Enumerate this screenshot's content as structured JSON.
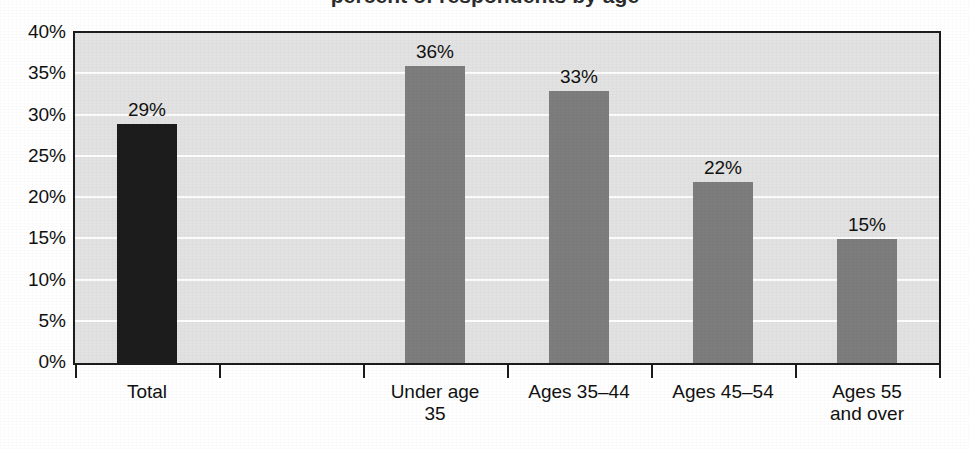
{
  "title_remnant": "percent of respondents by age",
  "chart_data": {
    "type": "bar",
    "title": "",
    "xlabel": "",
    "ylabel": "",
    "categories": [
      "Total",
      "",
      "Under age\n35",
      "Ages 35–44",
      "Ages 45–54",
      "Ages 55\nand over"
    ],
    "values": [
      29,
      null,
      36,
      33,
      22,
      15
    ],
    "data_labels": [
      "29%",
      "",
      "36%",
      "33%",
      "22%",
      "15%"
    ],
    "bar_colors": [
      "#1c1c1c",
      "",
      "#7d7d7d",
      "#7d7d7d",
      "#7d7d7d",
      "#7d7d7d"
    ],
    "ylim": [
      0,
      40
    ],
    "yticks": [
      0,
      5,
      10,
      15,
      20,
      25,
      30,
      35,
      40
    ],
    "ytick_labels": [
      "0%",
      "5%",
      "10%",
      "15%",
      "20%",
      "25%",
      "30%",
      "35%",
      "40%"
    ],
    "grid": true,
    "grid_axis": "y",
    "grid_color": "#fdfdfd",
    "legend": null,
    "plot_background": "#e2e2e2",
    "frame_color": "#1c1c1c",
    "highlight_color": "#1c1c1c",
    "series_color": "#7d7d7d"
  }
}
